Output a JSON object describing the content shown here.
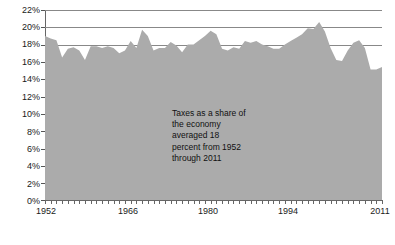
{
  "chart_data": {
    "type": "area",
    "title": "",
    "subtitle": "",
    "xlabel": "",
    "ylabel": "",
    "xlim": [
      1952,
      2011
    ],
    "ylim": [
      0,
      22
    ],
    "grid": true,
    "gridlines_at": [
      18,
      20,
      22
    ],
    "legend": null,
    "y_tick_labels": [
      "0%",
      "2%",
      "4%",
      "6%",
      "8%",
      "10%",
      "12%",
      "14%",
      "16%",
      "18%",
      "20%",
      "22%"
    ],
    "y_tick_values": [
      0,
      2,
      4,
      6,
      8,
      10,
      12,
      14,
      16,
      18,
      20,
      22
    ],
    "x_tick_labels": [
      "1952",
      "1966",
      "1980",
      "1994",
      "2011"
    ],
    "x_tick_values": [
      1952,
      1966,
      1980,
      1994,
      2011
    ],
    "series_name": "Taxes as a share of the economy",
    "annotation": "Taxes as a share of\nthe economy\naveraged 18\npercent from 1952\nthrough 2011",
    "annotation_x": 1975,
    "annotation_y": 10.4,
    "average_value": 18,
    "area_color": "#ababab",
    "gridline_color": "#888888",
    "axis_color": "#666666",
    "text_color": "#111111",
    "background_color": "#ffffff",
    "x": [
      1952,
      1953,
      1954,
      1955,
      1956,
      1957,
      1958,
      1959,
      1960,
      1961,
      1962,
      1963,
      1964,
      1965,
      1966,
      1967,
      1968,
      1969,
      1970,
      1971,
      1972,
      1973,
      1974,
      1975,
      1976,
      1977,
      1978,
      1979,
      1980,
      1981,
      1982,
      1983,
      1984,
      1985,
      1986,
      1987,
      1988,
      1989,
      1990,
      1991,
      1992,
      1993,
      1994,
      1995,
      1996,
      1997,
      1998,
      1999,
      2000,
      2001,
      2002,
      2003,
      2004,
      2005,
      2006,
      2007,
      2008,
      2009,
      2010,
      2011
    ],
    "values": [
      19.0,
      18.7,
      18.5,
      16.5,
      17.5,
      17.7,
      17.3,
      16.2,
      17.8,
      17.8,
      17.6,
      17.8,
      17.6,
      17.0,
      17.3,
      18.4,
      17.6,
      19.7,
      19.0,
      17.3,
      17.6,
      17.6,
      18.3,
      17.9,
      17.1,
      18.0,
      18.0,
      18.5,
      19.0,
      19.6,
      19.2,
      17.5,
      17.3,
      17.7,
      17.5,
      18.4,
      18.2,
      18.4,
      18.0,
      17.8,
      17.5,
      17.5,
      18.0,
      18.4,
      18.8,
      19.2,
      19.9,
      19.8,
      20.6,
      19.5,
      17.6,
      16.2,
      16.1,
      17.3,
      18.2,
      18.5,
      17.6,
      15.1,
      15.1,
      15.4
    ],
    "value_unit": "% of GDP"
  },
  "plot_geometry": {
    "left": 45,
    "right": 382,
    "top": 10,
    "bottom": 200
  }
}
